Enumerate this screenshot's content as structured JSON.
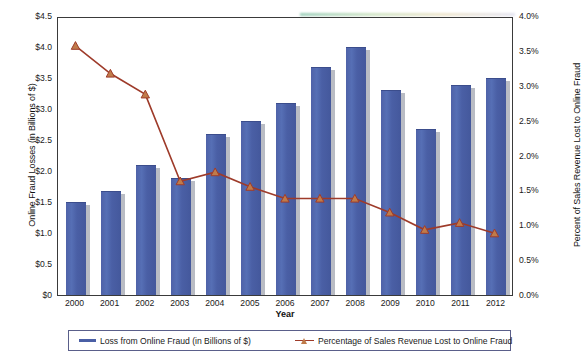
{
  "chart_data": {
    "type": "bar",
    "title": "",
    "xlabel": "Year",
    "ylabel": "Online Fraud Losses (in Billions of $)",
    "ylabel_right": "Percent of Sales Revenue Lost to Online Fraud",
    "categories": [
      "2000",
      "2001",
      "2002",
      "2003",
      "2004",
      "2005",
      "2006",
      "2007",
      "2008",
      "2009",
      "2010",
      "2011",
      "2012"
    ],
    "ylim": [
      0,
      4.5
    ],
    "ylim_right": [
      0,
      4.0
    ],
    "ytick_labels": [
      "$0",
      "$0.5",
      "$1.0",
      "$1.5",
      "$2.0",
      "$2.5",
      "$3.0",
      "$3.5",
      "$4.0",
      "$4.5"
    ],
    "ytick_values": [
      0,
      0.5,
      1.0,
      1.5,
      2.0,
      2.5,
      3.0,
      3.5,
      4.0,
      4.5
    ],
    "ytick_labels_right": [
      "0.0%",
      "0.5%",
      "1.0%",
      "1.5%",
      "2.0%",
      "2.5%",
      "3.0%",
      "3.5%",
      "4.0%"
    ],
    "ytick_values_right": [
      0,
      0.5,
      1.0,
      1.5,
      2.0,
      2.5,
      3.0,
      3.5,
      4.0
    ],
    "grid": false,
    "legend_position": "bottom",
    "series": [
      {
        "name": "Loss from Online Fraud (in Billions of $)",
        "type": "bar",
        "axis": "left",
        "color": "#4a5fa5",
        "values": [
          1.5,
          1.68,
          2.1,
          1.88,
          2.6,
          2.8,
          3.1,
          3.68,
          4.0,
          3.3,
          2.68,
          3.38,
          3.5
        ]
      },
      {
        "name": "Percentage of Sales Revenue Lost to Online Fraud",
        "type": "line",
        "axis": "right",
        "color": "#9e3b2a",
        "marker_color": "#c07b4a",
        "values": [
          3.6,
          3.2,
          2.9,
          1.65,
          1.78,
          1.57,
          1.4,
          1.4,
          1.4,
          1.2,
          0.95,
          1.05,
          0.9
        ]
      }
    ]
  },
  "legend": {
    "bar_label": "Loss from Online Fraud (in Billions of $)",
    "line_label": "Percentage of Sales Revenue Lost to Online Fraud"
  }
}
